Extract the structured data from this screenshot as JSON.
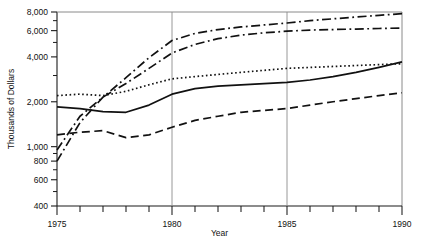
{
  "chart_data": {
    "type": "line",
    "title": "",
    "xlabel": "Year",
    "ylabel": "Thousands of Dollars",
    "yscale": "log",
    "ylim": [
      400,
      8000
    ],
    "xlim": [
      1975,
      1990
    ],
    "grid": "vertical gridlines at 1980 and 1985",
    "legend": "none",
    "y_ticks": [
      400,
      600,
      800,
      1000,
      2000,
      4000,
      6000,
      8000
    ],
    "y_tick_labels": [
      "400",
      "600",
      "800",
      "1,000",
      "2,000",
      "4,000",
      "6,000",
      "8,000"
    ],
    "x_ticks": [
      1975,
      1976,
      1977,
      1978,
      1979,
      1980,
      1981,
      1982,
      1983,
      1984,
      1985,
      1986,
      1987,
      1988,
      1989,
      1990
    ],
    "x_tick_labels": [
      "1975",
      "",
      "",
      "",
      "",
      "1980",
      "",
      "",
      "",
      "",
      "1985",
      "",
      "",
      "",
      "",
      "1990"
    ],
    "x": [
      1975,
      1976,
      1977,
      1978,
      1979,
      1980,
      1981,
      1982,
      1983,
      1984,
      1985,
      1986,
      1987,
      1988,
      1989,
      1990
    ],
    "series": [
      {
        "name": "series-dashdot-upper",
        "style": "dashdot",
        "values": [
          800,
          1450,
          2150,
          2900,
          3950,
          5150,
          5750,
          6100,
          6350,
          6550,
          6750,
          7000,
          7200,
          7400,
          7600,
          7800
        ]
      },
      {
        "name": "series-dashdot-lower",
        "style": "dashdot",
        "values": [
          950,
          1600,
          2150,
          2650,
          3350,
          4250,
          4850,
          5300,
          5600,
          5800,
          5950,
          6050,
          6100,
          6150,
          6200,
          6250
        ]
      },
      {
        "name": "series-dotted",
        "style": "dotted",
        "values": [
          2200,
          2250,
          2200,
          2350,
          2600,
          2850,
          2950,
          3050,
          3150,
          3250,
          3350,
          3400,
          3450,
          3500,
          3550,
          3600
        ]
      },
      {
        "name": "series-solid",
        "style": "solid",
        "values": [
          1850,
          1800,
          1720,
          1700,
          1900,
          2250,
          2450,
          2550,
          2600,
          2650,
          2700,
          2800,
          2950,
          3150,
          3400,
          3700
        ]
      },
      {
        "name": "series-dashed",
        "style": "dashed",
        "values": [
          1200,
          1250,
          1280,
          1150,
          1200,
          1350,
          1500,
          1600,
          1700,
          1750,
          1800,
          1900,
          2000,
          2100,
          2200,
          2300
        ]
      }
    ]
  },
  "axes": {
    "y_axis_title": "Thousands of Dollars",
    "x_axis_title": "Year"
  }
}
